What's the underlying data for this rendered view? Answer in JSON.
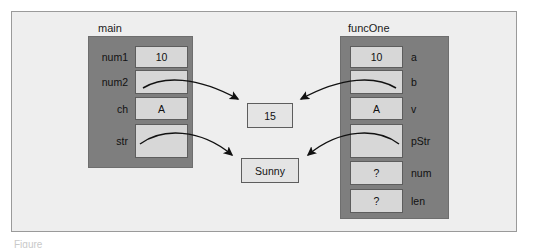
{
  "figure": {
    "caption_sliver": "Figure"
  },
  "stacks": [
    {
      "id": "main",
      "title": "main",
      "label_side": "left",
      "variables": [
        {
          "label": "num1",
          "value": "10"
        },
        {
          "label": "num2",
          "value": ""
        },
        {
          "label": "ch",
          "value": "A"
        },
        {
          "label": "str",
          "value": ""
        }
      ]
    },
    {
      "id": "funcOne",
      "title": "funcOne",
      "label_side": "right",
      "variables": [
        {
          "label": "a",
          "value": "10"
        },
        {
          "label": "b",
          "value": ""
        },
        {
          "label": "v",
          "value": "A"
        },
        {
          "label": "pStr",
          "value": ""
        },
        {
          "label": "num",
          "value": "?"
        },
        {
          "label": "len",
          "value": "?"
        }
      ]
    }
  ],
  "heap_values": [
    {
      "id": "int-value",
      "value": "15"
    },
    {
      "id": "string-value",
      "value": "Sunny"
    }
  ],
  "pointers": [
    {
      "id": "main-num2-to-15",
      "from": "main.num2",
      "to": "int-value"
    },
    {
      "id": "funcone-b-to-15",
      "from": "funcOne.b",
      "to": "int-value"
    },
    {
      "id": "main-str-to-sunny",
      "from": "main.str",
      "to": "string-value"
    },
    {
      "id": "funcone-pstr-to-sunny",
      "from": "funcOne.pStr",
      "to": "string-value"
    }
  ],
  "colors": {
    "page_background": "#ffffff",
    "figure_background": "#eeeeee",
    "figure_border": "#9a9a9a",
    "stack_fill": "#7e7e7e",
    "stack_border": "#6e6e6e",
    "var_box_fill": "#d7d7d7",
    "var_box_border": "#5d5d5d",
    "heap_box_fill": "#e4e4e4",
    "heap_box_border": "#5d5d5d",
    "arrow_stroke": "#111111",
    "text": "#111111"
  }
}
